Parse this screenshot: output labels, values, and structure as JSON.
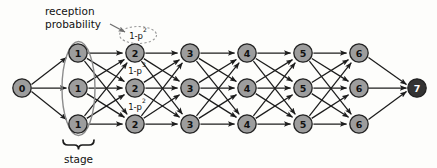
{
  "figure": {
    "colors": {
      "node_fill": "#9d9d9d",
      "sink_node_fill": "#333333",
      "node_stroke": "#222222",
      "edge": "#1c1c1c",
      "stage_ellipse": "#8c8c8c",
      "prob_ellipse": "#9a9a9a",
      "background": "#fdfdfb"
    },
    "annotations": {
      "reception_probability_line1": "reception",
      "reception_probability_line2": "probability",
      "stage_label": "stage"
    },
    "probability_labels": [
      {
        "id": "prob-top",
        "base": "1-p",
        "exponent": "2",
        "row": "top",
        "dashed": true
      },
      {
        "id": "prob-middle",
        "base": "1-p",
        "exponent": "3",
        "row": "middle",
        "dashed": false
      },
      {
        "id": "prob-bottom",
        "base": "1-p",
        "exponent": "2",
        "row": "bottom",
        "dashed": false
      }
    ],
    "nodes": {
      "source": {
        "label": "0",
        "x": 22,
        "y": 88
      },
      "sink": {
        "label": "7",
        "x": 417,
        "y": 88
      },
      "columns": [
        {
          "label": "1",
          "x": 78
        },
        {
          "label": "2",
          "x": 135
        },
        {
          "label": "3",
          "x": 190
        },
        {
          "label": "4",
          "x": 247
        },
        {
          "label": "5",
          "x": 303
        },
        {
          "label": "6",
          "x": 359
        }
      ],
      "rows": [
        {
          "name": "top",
          "y": 53
        },
        {
          "name": "middle",
          "y": 88
        },
        {
          "name": "bottom",
          "y": 124
        }
      ],
      "radius": 9.2
    }
  },
  "chart_data": {
    "type": "diagram",
    "stage_count": 7,
    "nodes_per_stage": 3,
    "stage_labels": [
      "0",
      "1",
      "2",
      "3",
      "4",
      "5",
      "6",
      "7"
    ],
    "row_labels": [
      "top",
      "middle",
      "bottom"
    ],
    "edge_pattern": "each node connects to all three nodes of the next stage (horizontal plus two diagonals); stage 0 fans out to three nodes, stage 6 fans in to the single sink",
    "probability_annotations": [
      "1-p^2",
      "1-p^3",
      "1-p^2"
    ],
    "annotations": [
      "reception probability",
      "stage"
    ]
  }
}
